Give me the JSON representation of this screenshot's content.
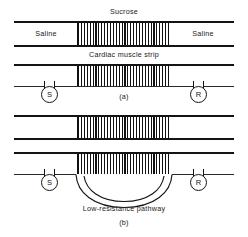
{
  "figure": {
    "background_color": "#ffffff",
    "line_color": "#141414",
    "width": 248,
    "height": 237
  },
  "panel_a": {
    "caption": "(a)",
    "labels": {
      "top_center": "Sucrose",
      "left_compartment": "Saline",
      "right_compartment": "Saline",
      "middle_center": "Cardiac muscle strip"
    },
    "electrodes": [
      {
        "id": "stimulating",
        "glyph": "S",
        "side": "left"
      },
      {
        "id": "recording",
        "glyph": "R",
        "side": "right"
      }
    ],
    "gap_region": {
      "name": "sucrose-gap",
      "fill": "vertical-hatching"
    }
  },
  "panel_b": {
    "caption": "(b)",
    "labels": {
      "pathway": "Low-resistance pathway"
    },
    "electrodes": [
      {
        "id": "stimulating",
        "glyph": "S",
        "side": "left"
      },
      {
        "id": "recording",
        "glyph": "R",
        "side": "right"
      }
    ],
    "gap_region": {
      "name": "sucrose-gap",
      "fill": "vertical-hatching"
    }
  }
}
